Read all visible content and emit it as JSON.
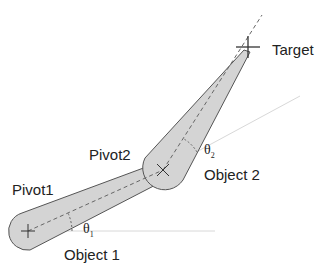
{
  "labels": {
    "pivot1": "Pivot1",
    "pivot2": "Pivot2",
    "target": "Target",
    "object1": "Object 1",
    "object2": "Object 2",
    "theta1": "θ",
    "theta1_sub": "1",
    "theta2": "θ",
    "theta2_sub": "2"
  },
  "colors": {
    "link_fill": "#d4d4d4",
    "link_stroke": "#555555",
    "dash": "#666666",
    "ref_line": "#cccccc"
  }
}
